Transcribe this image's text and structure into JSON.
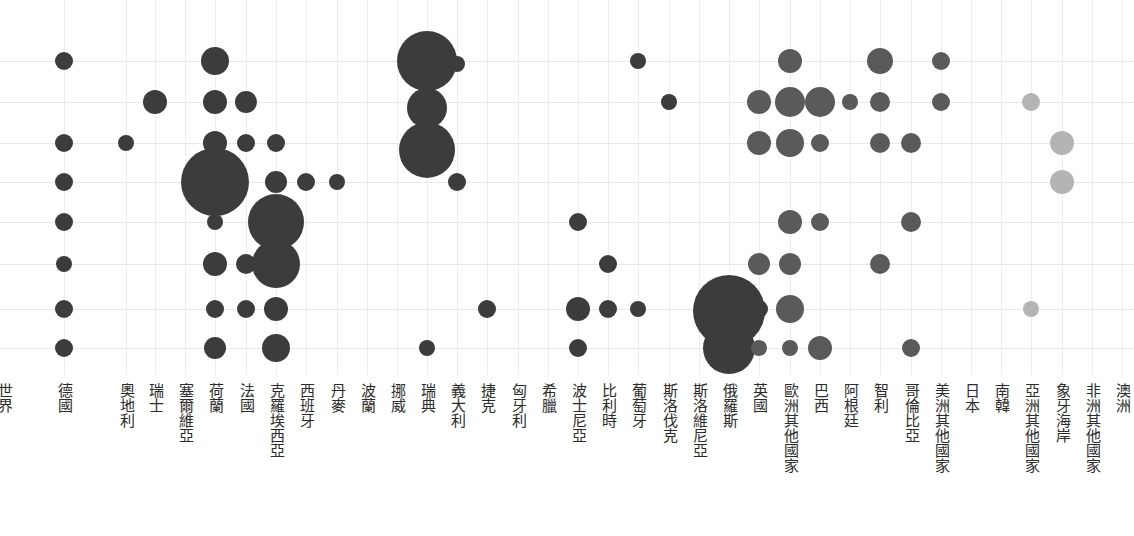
{
  "chart_data": {
    "type": "scatter",
    "title": "",
    "subtitle": "",
    "xlabel": "",
    "ylabel": "",
    "grid": true,
    "legend": null,
    "x_tick_labels": [
      "世界",
      "德國",
      "奧地利",
      "瑞士",
      "塞爾維亞",
      "荷蘭",
      "法國",
      "克羅埃西亞",
      "西班牙",
      "丹麥",
      "波蘭",
      "挪威",
      "瑞典",
      "義大利",
      "捷克",
      "匈牙利",
      "希臘",
      "波士尼亞",
      "比利時",
      "葡萄牙",
      "斯洛伐克",
      "斯洛維尼亞",
      "俄羅斯",
      "英國",
      "歐洲其他國家",
      "巴西",
      "阿根廷",
      "智利",
      "哥倫比亞",
      "美洲其他國家",
      "日本",
      "南韓",
      "亞洲其他國家",
      "象牙海岸",
      "非洲其他國家",
      "澳洲"
    ],
    "x_tick_positions": [
      4,
      64,
      126,
      155,
      185,
      215,
      246,
      276,
      306,
      337,
      367,
      397,
      427,
      457,
      487,
      518,
      548,
      578,
      608,
      638,
      669,
      699,
      729,
      759,
      790,
      820,
      850,
      880,
      911,
      941,
      971,
      1001,
      1031,
      1062,
      1092,
      1122
    ],
    "y_gridlines": [
      61,
      102,
      143,
      182,
      222,
      264,
      309,
      348
    ],
    "colors": {
      "dark": "#3c3c3c",
      "medium": "#5a5a5a",
      "light": "#b4b4b4",
      "gridline": "#e8e8e8",
      "background": "#ffffff",
      "label": "#2b2b2b"
    },
    "points": [
      {
        "c": "德國",
        "x": 64,
        "y": 61,
        "r": 9,
        "color": "dark"
      },
      {
        "c": "德國",
        "x": 64,
        "y": 143,
        "r": 9,
        "color": "dark"
      },
      {
        "c": "德國",
        "x": 64,
        "y": 182,
        "r": 9,
        "color": "dark"
      },
      {
        "c": "德國",
        "x": 64,
        "y": 222,
        "r": 9,
        "color": "dark"
      },
      {
        "c": "德國",
        "x": 64,
        "y": 264,
        "r": 8,
        "color": "dark"
      },
      {
        "c": "德國",
        "x": 64,
        "y": 309,
        "r": 9,
        "color": "dark"
      },
      {
        "c": "德國",
        "x": 64,
        "y": 348,
        "r": 9,
        "color": "dark"
      },
      {
        "c": "奧地利",
        "x": 126,
        "y": 143,
        "r": 8,
        "color": "dark"
      },
      {
        "c": "荷蘭",
        "x": 155,
        "y": 102,
        "r": 12,
        "color": "dark"
      },
      {
        "c": "法國",
        "x": 215,
        "y": 61,
        "r": 14,
        "color": "dark"
      },
      {
        "c": "法國",
        "x": 215,
        "y": 102,
        "r": 12,
        "color": "dark"
      },
      {
        "c": "法國",
        "x": 215,
        "y": 143,
        "r": 12,
        "color": "dark"
      },
      {
        "c": "法國",
        "x": 215,
        "y": 182,
        "r": 34,
        "color": "dark"
      },
      {
        "c": "法國",
        "x": 215,
        "y": 222,
        "r": 8,
        "color": "dark"
      },
      {
        "c": "法國",
        "x": 215,
        "y": 264,
        "r": 12,
        "color": "dark"
      },
      {
        "c": "法國",
        "x": 215,
        "y": 309,
        "r": 9,
        "color": "dark"
      },
      {
        "c": "法國",
        "x": 215,
        "y": 348,
        "r": 11,
        "color": "dark"
      },
      {
        "c": "克羅埃西亞",
        "x": 246,
        "y": 102,
        "r": 11,
        "color": "dark"
      },
      {
        "c": "克羅埃西亞",
        "x": 246,
        "y": 143,
        "r": 9,
        "color": "dark"
      },
      {
        "c": "克羅埃西亞",
        "x": 246,
        "y": 264,
        "r": 10,
        "color": "dark"
      },
      {
        "c": "克羅埃西亞",
        "x": 246,
        "y": 309,
        "r": 9,
        "color": "dark"
      },
      {
        "c": "西班牙",
        "x": 276,
        "y": 143,
        "r": 9,
        "color": "dark"
      },
      {
        "c": "西班牙",
        "x": 276,
        "y": 182,
        "r": 11,
        "color": "dark"
      },
      {
        "c": "西班牙",
        "x": 276,
        "y": 222,
        "r": 28,
        "color": "dark"
      },
      {
        "c": "西班牙",
        "x": 276,
        "y": 264,
        "r": 24,
        "color": "dark"
      },
      {
        "c": "西班牙",
        "x": 276,
        "y": 309,
        "r": 12,
        "color": "dark"
      },
      {
        "c": "西班牙",
        "x": 276,
        "y": 348,
        "r": 14,
        "color": "dark"
      },
      {
        "c": "丹麥",
        "x": 306,
        "y": 182,
        "r": 9,
        "color": "dark"
      },
      {
        "c": "波蘭",
        "x": 337,
        "y": 182,
        "r": 8,
        "color": "dark"
      },
      {
        "c": "瑞典",
        "x": 427,
        "y": 348,
        "r": 8,
        "color": "dark"
      },
      {
        "c": "義大利",
        "x": 427,
        "y": 61,
        "r": 30,
        "color": "dark"
      },
      {
        "c": "義大利",
        "x": 457,
        "y": 64,
        "r": 8,
        "color": "dark"
      },
      {
        "c": "義大利",
        "x": 427,
        "y": 108,
        "r": 20,
        "color": "dark"
      },
      {
        "c": "義大利",
        "x": 427,
        "y": 150,
        "r": 28,
        "color": "dark"
      },
      {
        "c": "義大利",
        "x": 457,
        "y": 182,
        "r": 9,
        "color": "dark"
      },
      {
        "c": "希臘",
        "x": 487,
        "y": 309,
        "r": 9,
        "color": "dark"
      },
      {
        "c": "波士尼亞",
        "x": 578,
        "y": 222,
        "r": 9,
        "color": "dark"
      },
      {
        "c": "波士尼亞",
        "x": 578,
        "y": 309,
        "r": 12,
        "color": "dark"
      },
      {
        "c": "波士尼亞",
        "x": 578,
        "y": 348,
        "r": 9,
        "color": "dark"
      },
      {
        "c": "比利時",
        "x": 608,
        "y": 309,
        "r": 9,
        "color": "dark"
      },
      {
        "c": "葡萄牙",
        "x": 608,
        "y": 264,
        "r": 9,
        "color": "dark"
      },
      {
        "c": "葡萄牙",
        "x": 638,
        "y": 309,
        "r": 8,
        "color": "dark"
      },
      {
        "c": "斯洛伐克",
        "x": 638,
        "y": 61,
        "r": 8,
        "color": "dark"
      },
      {
        "c": "斯洛維尼亞",
        "x": 669,
        "y": 102,
        "r": 8,
        "color": "dark"
      },
      {
        "c": "英國",
        "x": 729,
        "y": 311,
        "r": 36,
        "color": "dark"
      },
      {
        "c": "英國",
        "x": 729,
        "y": 348,
        "r": 26,
        "color": "dark"
      },
      {
        "c": "英國",
        "x": 759,
        "y": 309,
        "r": 9,
        "color": "dark"
      },
      {
        "c": "歐洲其他國家",
        "x": 759,
        "y": 102,
        "r": 12,
        "color": "medium"
      },
      {
        "c": "歐洲其他國家",
        "x": 759,
        "y": 143,
        "r": 12,
        "color": "medium"
      },
      {
        "c": "歐洲其他國家",
        "x": 759,
        "y": 264,
        "r": 11,
        "color": "medium"
      },
      {
        "c": "歐洲其他國家",
        "x": 759,
        "y": 348,
        "r": 8,
        "color": "medium"
      },
      {
        "c": "巴西",
        "x": 790,
        "y": 61,
        "r": 12,
        "color": "medium"
      },
      {
        "c": "巴西",
        "x": 790,
        "y": 102,
        "r": 15,
        "color": "medium"
      },
      {
        "c": "巴西",
        "x": 790,
        "y": 143,
        "r": 14,
        "color": "medium"
      },
      {
        "c": "巴西",
        "x": 790,
        "y": 222,
        "r": 12,
        "color": "medium"
      },
      {
        "c": "巴西",
        "x": 790,
        "y": 264,
        "r": 11,
        "color": "medium"
      },
      {
        "c": "巴西",
        "x": 790,
        "y": 309,
        "r": 14,
        "color": "medium"
      },
      {
        "c": "巴西",
        "x": 790,
        "y": 348,
        "r": 8,
        "color": "medium"
      },
      {
        "c": "阿根廷",
        "x": 820,
        "y": 102,
        "r": 15,
        "color": "medium"
      },
      {
        "c": "阿根廷",
        "x": 820,
        "y": 143,
        "r": 9,
        "color": "medium"
      },
      {
        "c": "阿根廷",
        "x": 820,
        "y": 222,
        "r": 9,
        "color": "medium"
      },
      {
        "c": "阿根廷",
        "x": 820,
        "y": 348,
        "r": 12,
        "color": "medium"
      },
      {
        "c": "智利",
        "x": 850,
        "y": 102,
        "r": 8,
        "color": "medium"
      },
      {
        "c": "哥倫比亞",
        "x": 880,
        "y": 61,
        "r": 13,
        "color": "medium"
      },
      {
        "c": "哥倫比亞",
        "x": 880,
        "y": 102,
        "r": 10,
        "color": "medium"
      },
      {
        "c": "哥倫比亞",
        "x": 880,
        "y": 143,
        "r": 10,
        "color": "medium"
      },
      {
        "c": "哥倫比亞",
        "x": 880,
        "y": 264,
        "r": 10,
        "color": "medium"
      },
      {
        "c": "美洲其他國家",
        "x": 911,
        "y": 143,
        "r": 10,
        "color": "medium"
      },
      {
        "c": "美洲其他國家",
        "x": 911,
        "y": 222,
        "r": 10,
        "color": "medium"
      },
      {
        "c": "美洲其他國家",
        "x": 911,
        "y": 348,
        "r": 9,
        "color": "medium"
      },
      {
        "c": "日本",
        "x": 941,
        "y": 61,
        "r": 9,
        "color": "medium"
      },
      {
        "c": "日本",
        "x": 941,
        "y": 102,
        "r": 9,
        "color": "medium"
      },
      {
        "c": "象牙海岸",
        "x": 1031,
        "y": 102,
        "r": 9,
        "color": "light"
      },
      {
        "c": "象牙海岸",
        "x": 1031,
        "y": 309,
        "r": 8,
        "color": "light"
      },
      {
        "c": "非洲其他國家",
        "x": 1062,
        "y": 143,
        "r": 12,
        "color": "light"
      },
      {
        "c": "非洲其他國家",
        "x": 1062,
        "y": 182,
        "r": 12,
        "color": "light"
      }
    ]
  }
}
